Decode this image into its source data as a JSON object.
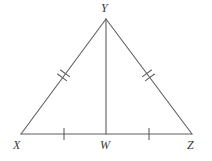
{
  "figure": {
    "kind": "isosceles-triangle-with-altitude",
    "background_color": "#ffffff",
    "stroke_color": "#5f5f63",
    "label_color": "#3a3a3a",
    "stroke_width": 1.1,
    "tick_stroke_width": 1.1
  },
  "points": {
    "X": {
      "label": "X",
      "x": 21,
      "y": 134,
      "label_x": 13,
      "label_y": 139
    },
    "Y": {
      "label": "Y",
      "x": 106,
      "y": 19,
      "label_x": 101,
      "label_y": 2
    },
    "Z": {
      "label": "Z",
      "x": 192,
      "y": 134,
      "label_x": 187,
      "label_y": 139
    },
    "W": {
      "label": "W",
      "x": 106,
      "y": 134,
      "label_x": 100,
      "label_y": 139
    }
  },
  "segments": [
    {
      "name": "XY",
      "from": "X",
      "to": "Y",
      "ticks": 2
    },
    {
      "name": "YZ",
      "from": "Y",
      "to": "Z",
      "ticks": 2
    },
    {
      "name": "XZ",
      "from": "X",
      "to": "Z",
      "ticks": 0
    },
    {
      "name": "YW",
      "from": "Y",
      "to": "W",
      "ticks": 0
    },
    {
      "name": "XW",
      "from": "X",
      "to": "W",
      "ticks": 1
    },
    {
      "name": "WZ",
      "from": "W",
      "to": "Z",
      "ticks": 1
    }
  ],
  "tick_marks": {
    "xy": {
      "count": 2,
      "cx": 64,
      "cy": 76
    },
    "yz": {
      "count": 2,
      "cx": 149,
      "cy": 76
    },
    "xw": {
      "count": 1,
      "cx": 64,
      "cy": 134
    },
    "wz": {
      "count": 1,
      "cx": 149,
      "cy": 134
    }
  }
}
